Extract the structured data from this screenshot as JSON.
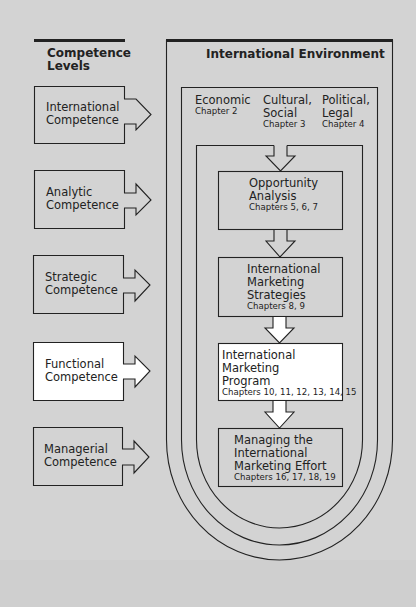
{
  "left_column": {
    "heading": [
      "Competence",
      "Levels"
    ],
    "levels": [
      {
        "line1": "International",
        "line2": "Competence",
        "highlighted": false
      },
      {
        "line1": "Analytic",
        "line2": "Competence",
        "highlighted": false
      },
      {
        "line1": "Strategic",
        "line2": "Competence",
        "highlighted": false
      },
      {
        "line1": "Functional",
        "line2": "Competence",
        "highlighted": true
      },
      {
        "line1": "Managerial",
        "line2": "Competence",
        "highlighted": false
      }
    ]
  },
  "environment": {
    "title": "International Environment",
    "factors": [
      {
        "name": "Economic",
        "name2": "",
        "chapter": "Chapter 2"
      },
      {
        "name": "Cultural,",
        "name2": "Social",
        "chapter": "Chapter 3"
      },
      {
        "name": "Political,",
        "name2": "Legal",
        "chapter": "Chapter 4"
      }
    ]
  },
  "stages": [
    {
      "lines": [
        "Opportunity",
        "Analysis"
      ],
      "chapters": "Chapters 5, 6, 7",
      "highlighted": false
    },
    {
      "lines": [
        "International",
        "Marketing",
        "Strategies"
      ],
      "chapters": "Chapters 8, 9",
      "highlighted": false
    },
    {
      "lines": [
        "International",
        "Marketing",
        "Program"
      ],
      "chapters": "Chapters 10, 11, 12, 13, 14, 15",
      "highlighted": true
    },
    {
      "lines": [
        "Managing the",
        "International",
        "Marketing Effort"
      ],
      "chapters": "Chapters 16, 17, 18, 19",
      "highlighted": false
    }
  ],
  "colors": {
    "background": "#d3d3d3",
    "line": "#222222",
    "highlight": "#ffffff"
  }
}
